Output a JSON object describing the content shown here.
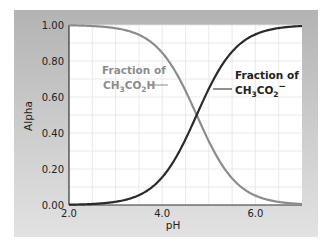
{
  "chart_data": {
    "type": "line",
    "title": "",
    "xlabel": "pH",
    "ylabel": "Alpha",
    "xlim": [
      2.0,
      7.0
    ],
    "ylim": [
      0.0,
      1.0
    ],
    "xticks": [
      "2.0",
      "4.0",
      "6.0"
    ],
    "yticks": [
      "0.00",
      "0.20",
      "0.40",
      "0.60",
      "0.80",
      "1.00"
    ],
    "grid": true,
    "legend": "inline annotations",
    "pKa": 4.74,
    "x": [
      2.0,
      2.5,
      3.0,
      3.5,
      4.0,
      4.25,
      4.5,
      4.74,
      5.0,
      5.25,
      5.5,
      6.0,
      6.5,
      7.0
    ],
    "series": [
      {
        "name": "Fraction of CH3CO2H",
        "color": "#8c8c8c",
        "values": [
          1.0,
          0.99,
          0.98,
          0.95,
          0.85,
          0.76,
          0.63,
          0.5,
          0.35,
          0.24,
          0.15,
          0.05,
          0.02,
          0.01
        ]
      },
      {
        "name": "Fraction of CH3CO2−",
        "color": "#2a2a2a",
        "values": [
          0.0,
          0.01,
          0.02,
          0.05,
          0.15,
          0.24,
          0.37,
          0.5,
          0.65,
          0.76,
          0.85,
          0.95,
          0.98,
          0.99
        ]
      }
    ],
    "annotations": [
      {
        "line1": "Fraction of",
        "line2_base": "CH",
        "sub1": "3",
        "mid": "CO",
        "sub2": "2",
        "end": "H",
        "target": "acid curve"
      },
      {
        "line1": "Fraction of",
        "line2_base": "CH",
        "sub1": "3",
        "mid": "CO",
        "sub2": "2",
        "end": "−",
        "target": "acetate curve"
      }
    ]
  }
}
